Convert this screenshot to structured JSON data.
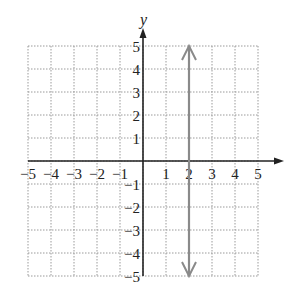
{
  "chart_data": {
    "type": "line",
    "title": "",
    "xlabel": "x",
    "ylabel": "y",
    "xlim": [
      -5,
      5
    ],
    "ylim": [
      -5,
      5
    ],
    "grid": true,
    "x_ticks": [
      -5,
      -4,
      -3,
      -2,
      -1,
      1,
      2,
      3,
      4,
      5
    ],
    "y_ticks": [
      5,
      4,
      3,
      2,
      1,
      -1,
      -2,
      -3,
      -4,
      -5
    ],
    "x_tick_labels": [
      "−5",
      "−4",
      "−3",
      "−2",
      "−1",
      "1",
      "2",
      "3",
      "4",
      "5"
    ],
    "y_tick_labels": [
      "5",
      "4",
      "3",
      "2",
      "1",
      "−1",
      "−2",
      "−3",
      "−4",
      "−5"
    ],
    "series": [
      {
        "name": "x = 2",
        "description": "vertical line with arrows at both ends",
        "points": [
          [
            2,
            -5
          ],
          [
            2,
            5
          ]
        ],
        "color": "#8a8a8a"
      }
    ],
    "legend": "none"
  },
  "colors": {
    "axis": "#222222",
    "grid": "#9a9a9a",
    "line": "#8a8a8a"
  }
}
